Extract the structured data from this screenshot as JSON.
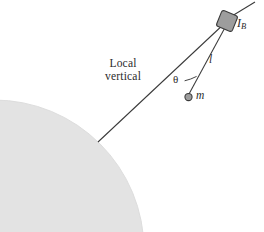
{
  "figure": {
    "kind": "physics-diagram",
    "background_color": "#ffffff",
    "stroke_color": "#3a3a3a",
    "text_color": "#2b2b2b",
    "earth": {
      "name": "earth-quadrant",
      "fill_color": "#e3e3e3",
      "edge_color": "#dcdcdc",
      "center_x": -6,
      "center_y": 250,
      "radius": 150
    },
    "body": {
      "name": "rigid-body-box",
      "label": "I",
      "label_subscript": "B",
      "fill_color": "#9d9d9d",
      "edge_color": "#3a3a3a",
      "center_x": 227,
      "center_y": 21,
      "size": 17,
      "rotation_deg": 22
    },
    "mass": {
      "name": "point-mass",
      "label": "m",
      "fill_color": "#9d9d9d",
      "edge_color": "#3a3a3a",
      "center_x": 188.5,
      "center_y": 97,
      "radius": 3.6
    },
    "tether": {
      "name": "tether-line",
      "label": "l",
      "from_x": 227,
      "from_y": 21,
      "to_x": 188.5,
      "to_y": 97
    },
    "local_vertical": {
      "name": "local-vertical-line",
      "label_line_1": "Local",
      "label_line_2": "vertical",
      "from_x": 98,
      "from_y": 142,
      "to_x": 227,
      "to_y": 21
    },
    "angle": {
      "name": "angle-theta",
      "label": "θ",
      "vertex_x": 227,
      "vertex_y": 21,
      "value_deg": 22
    },
    "axis_extension": {
      "name": "body-axis-extension",
      "from_x": 232,
      "from_y": 16,
      "to_x": 255,
      "to_y": 2
    }
  }
}
